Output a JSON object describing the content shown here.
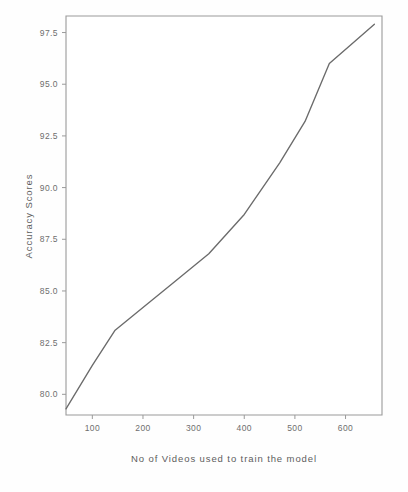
{
  "chart_data": {
    "type": "line",
    "title": "",
    "subtitle": "",
    "xlabel": "No of Videos used to train the model",
    "ylabel": "Accuracy Scores",
    "xlim": [
      48,
      672
    ],
    "ylim": [
      79.0,
      98.3
    ],
    "xticks": [
      100,
      200,
      300,
      400,
      500,
      600
    ],
    "xtick_labels": [
      "100",
      "200",
      "300",
      "400",
      "500",
      "600"
    ],
    "yticks": [
      80.0,
      82.5,
      85.0,
      87.5,
      90.0,
      92.5,
      95.0,
      97.5
    ],
    "ytick_labels": [
      "80.0",
      "82.5",
      "85.0",
      "87.5",
      "90.0",
      "92.5",
      "95.0",
      "97.5"
    ],
    "grid": false,
    "legend": null,
    "legend_position": "none",
    "series": [
      {
        "name": "Accuracy",
        "color": "#6b6b6b",
        "marker": "none",
        "x": [
          48,
          100,
          145,
          200,
          260,
          330,
          400,
          470,
          520,
          568,
          610,
          657
        ],
        "y": [
          79.3,
          81.4,
          83.1,
          84.2,
          85.4,
          86.8,
          88.7,
          91.2,
          93.2,
          96.0,
          96.9,
          97.9
        ]
      }
    ]
  },
  "axes": {
    "x_axis_title": "No of Videos used to train the model",
    "y_axis_title": "Accuracy Scores"
  },
  "colors": {
    "line": "#6b6b6b",
    "frame": "#9a9a9a",
    "text": "#6e6e6e",
    "background": "#fefefe"
  }
}
